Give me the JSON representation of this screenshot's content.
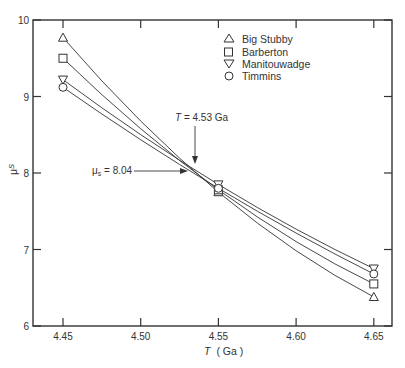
{
  "chart_data": {
    "type": "line",
    "title": "",
    "xlabel": "T (Ga)",
    "ylabel": "μs",
    "x": [
      4.45,
      4.55,
      4.65
    ],
    "xlim": [
      4.43,
      4.66
    ],
    "ylim": [
      6,
      10
    ],
    "xticks": [
      "4.45",
      "4.50",
      "4.55",
      "4.60",
      "4.65"
    ],
    "yticks": [
      "6",
      "7",
      "8",
      "9",
      "10"
    ],
    "grid": false,
    "legend_position": "upper right",
    "series": [
      {
        "name": "Big Stubby",
        "marker": "triangle-up",
        "values": [
          9.77,
          7.75,
          6.38
        ]
      },
      {
        "name": "Barberton",
        "marker": "square",
        "values": [
          9.5,
          7.78,
          6.55
        ]
      },
      {
        "name": "Manitouwadge",
        "marker": "triangle-down",
        "values": [
          9.22,
          7.85,
          6.75
        ]
      },
      {
        "name": "Timmins",
        "marker": "circle",
        "values": [
          9.12,
          7.8,
          6.68
        ]
      }
    ],
    "annotations": [
      {
        "text": "T = 4.53 Ga",
        "x": 4.53,
        "y": 8.04,
        "arrow": "down"
      },
      {
        "text": "μs = 8.04",
        "x": 4.53,
        "y": 8.04,
        "arrow": "right"
      }
    ]
  },
  "labels": {
    "xlabel_italic": "T",
    "xlabel_unit": "( Ga )",
    "ylabel_main": "μ",
    "ylabel_sub": "S",
    "annot_T": "T = 4.53  Ga",
    "annot_mu": "μ",
    "annot_mu_rest": " = 8.04",
    "annot_mu_sub": "s"
  },
  "legend": [
    {
      "label": "Big Stubby",
      "marker": "triangle-up"
    },
    {
      "label": "Barberton",
      "marker": "square"
    },
    {
      "label": "Manitouwadge",
      "marker": "triangle-down"
    },
    {
      "label": "Timmins",
      "marker": "circle"
    }
  ]
}
